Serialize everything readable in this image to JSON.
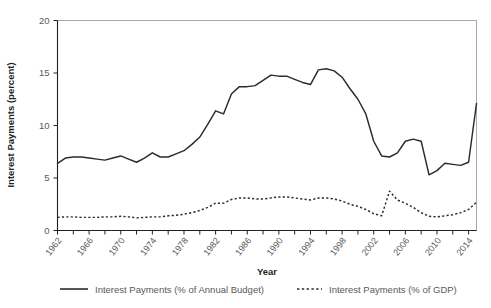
{
  "chart_data": {
    "type": "line",
    "title": "",
    "xlabel": "Year",
    "ylabel": "Interest Payments (percent)",
    "xlim": [
      1962,
      2015
    ],
    "ylim": [
      0,
      20
    ],
    "yticks": [
      0,
      5,
      10,
      15,
      20
    ],
    "ytick_labels": [
      "0",
      "5",
      "10",
      "15",
      "20"
    ],
    "xticks": [
      1962,
      1964,
      1966,
      1968,
      1970,
      1972,
      1974,
      1976,
      1978,
      1980,
      1982,
      1984,
      1986,
      1988,
      1990,
      1992,
      1994,
      1996,
      1998,
      2000,
      2002,
      2004,
      2006,
      2008,
      2010,
      2012,
      2014
    ],
    "xtick_labels_shown": [
      "1962",
      "1966",
      "1970",
      "1974",
      "1978",
      "1982",
      "1986",
      "1990",
      "1994",
      "1998",
      "2002",
      "2006",
      "2010",
      "2014"
    ],
    "xtick_label_interval": 4,
    "grid": false,
    "legend_position": "bottom",
    "x": [
      1962,
      1963,
      1964,
      1965,
      1966,
      1967,
      1968,
      1969,
      1970,
      1971,
      1972,
      1973,
      1974,
      1975,
      1976,
      1977,
      1978,
      1979,
      1980,
      1981,
      1982,
      1983,
      1984,
      1985,
      1986,
      1987,
      1988,
      1989,
      1990,
      1991,
      1992,
      1993,
      1994,
      1995,
      1996,
      1997,
      1998,
      1999,
      2000,
      2001,
      2002,
      2003,
      2004,
      2005,
      2006,
      2007,
      2008,
      2009,
      2010,
      2011,
      2012,
      2013,
      2014,
      2015
    ],
    "series": [
      {
        "name": "Interest Payments (% of Annual Budget)",
        "style": "solid",
        "color": "#2b2b2b",
        "values": [
          6.4,
          6.9,
          7.0,
          7.0,
          6.9,
          6.8,
          6.7,
          6.9,
          7.1,
          6.8,
          6.5,
          6.9,
          7.4,
          7.0,
          7.0,
          7.3,
          7.6,
          8.2,
          8.9,
          10.1,
          11.4,
          11.1,
          13.0,
          13.7,
          13.7,
          13.8,
          14.3,
          14.8,
          14.7,
          14.7,
          14.4,
          14.1,
          13.9,
          15.3,
          15.4,
          15.2,
          14.6,
          13.5,
          12.5,
          11.1,
          8.5,
          7.1,
          7.0,
          7.4,
          8.5,
          8.7,
          8.5,
          5.3,
          5.7,
          6.4,
          6.3,
          6.2,
          6.5,
          12.1
        ]
      },
      {
        "name": "Interest Payments (% of GDP)",
        "style": "dotted",
        "color": "#2b2b2b",
        "values": [
          1.25,
          1.3,
          1.3,
          1.25,
          1.25,
          1.25,
          1.3,
          1.3,
          1.35,
          1.3,
          1.2,
          1.25,
          1.3,
          1.3,
          1.4,
          1.45,
          1.55,
          1.7,
          1.9,
          2.2,
          2.6,
          2.6,
          2.95,
          3.1,
          3.1,
          3.0,
          3.0,
          3.1,
          3.2,
          3.2,
          3.1,
          3.0,
          2.9,
          3.1,
          3.1,
          3.0,
          2.8,
          2.5,
          2.3,
          2.0,
          1.6,
          1.4,
          3.75,
          2.9,
          2.6,
          2.2,
          1.7,
          1.35,
          1.3,
          1.4,
          1.5,
          1.7,
          2.0,
          2.7
        ]
      }
    ],
    "legend": [
      {
        "label": "Interest Payments (% of Annual Budget)",
        "style": "solid"
      },
      {
        "label": "Interest Payments (% of GDP)",
        "style": "dotted"
      }
    ]
  }
}
